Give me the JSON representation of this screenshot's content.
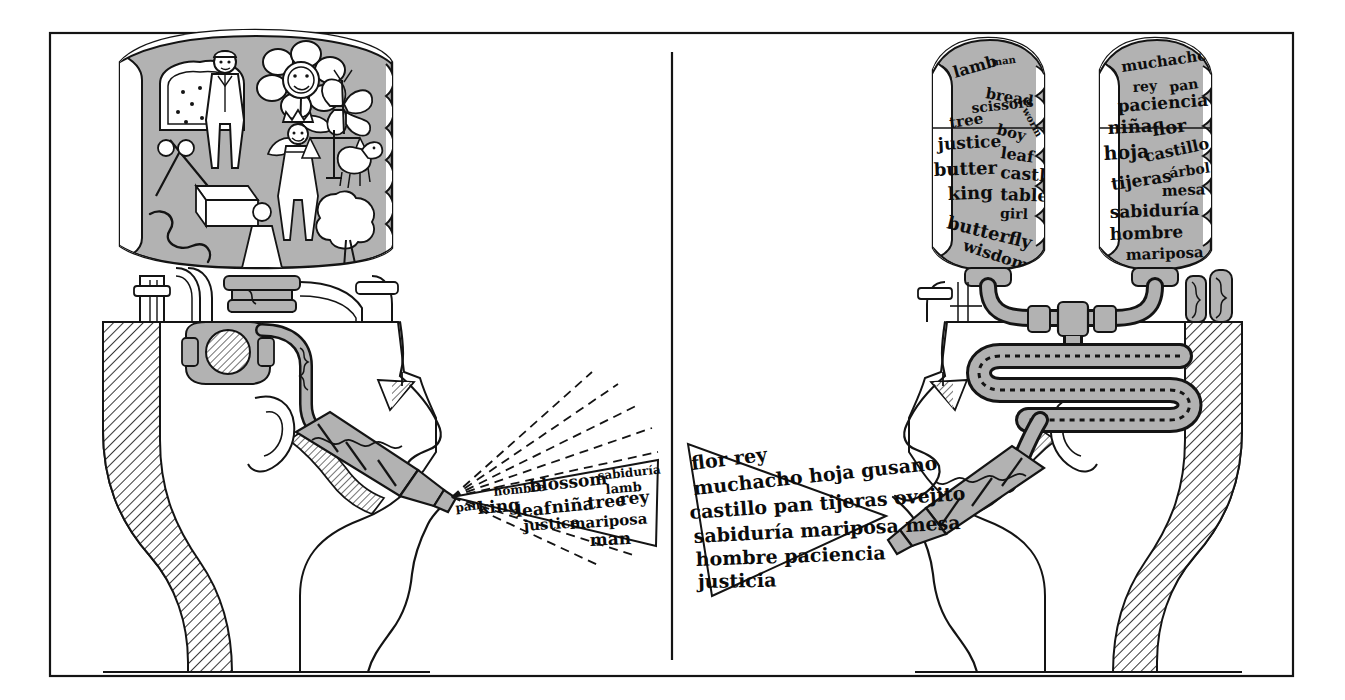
{
  "figure": {
    "caption": "",
    "style": "pen-and-ink technical cutaway",
    "colors": {
      "ink": "#141414",
      "gray": "#b2b2b2",
      "white": "#ffffff",
      "background": "#ffffff"
    },
    "frame": {
      "border_color": "#141414",
      "divider_label": "center-divider"
    }
  },
  "left_panel": {
    "name": "monolingual-head-panel",
    "description": "Head in profile facing right with a cutaway skull, a tank of pictures above, pipework inside the head, and a nozzle at the mouth emitting a cone of mixed-language words.",
    "tank": {
      "name": "picture-tank",
      "contents_type": "pictures",
      "items": [
        "bread-slice-icon",
        "man-icon",
        "flower-icon",
        "butterfly-icon",
        "king-icon",
        "scales-of-justice-icon",
        "lamb-icon",
        "tree-icon",
        "scissors-icon",
        "butter-icon",
        "worm-icon",
        "girl-icon"
      ]
    },
    "speech_cone": {
      "name": "speech-cone",
      "words": [
        "hombre",
        "blossom",
        "sabiduría",
        "pan",
        "king",
        "leaf",
        "niña",
        "tree",
        "rey",
        "lamb",
        "justice",
        "mariposa",
        "man"
      ],
      "lines": [
        "hombre blossom sabiduría",
        "lamb",
        "pan king leaf niña tree rey",
        "justice mariposa",
        "man"
      ],
      "rays": 8,
      "ray_style": "dashed"
    }
  },
  "right_panel": {
    "name": "bilingual-head-panel",
    "description": "Head in profile facing left with two word tanks above, a serpentine translation coil inside the skull, and a nozzle at the mouth emitting a cone of Spanish words.",
    "tanks": [
      {
        "name": "english-word-tank",
        "language": "English",
        "words": [
          "lamb",
          "man",
          "bread",
          "worm",
          "scissors",
          "tree",
          "boy",
          "justice",
          "leaf",
          "butter",
          "castle",
          "king",
          "table",
          "girl",
          "butterfly",
          "wisdom"
        ]
      },
      {
        "name": "spanish-word-tank",
        "language": "Spanish",
        "words": [
          "muchacho",
          "rey",
          "pan",
          "paciencia",
          "niña",
          "flor",
          "hoja",
          "castillo",
          "árbol",
          "tijeras",
          "mesa",
          "sabiduría",
          "hombre",
          "mariposa"
        ]
      }
    ],
    "speech_cone": {
      "name": "speech-cone",
      "lines": [
        "flor rey",
        "muchacho hoja gusano",
        "castillo pan tijeras ovejito",
        "árbol niña",
        "sabiduría mariposa mesa",
        "hombre paciencia",
        "justicia"
      ],
      "words": [
        "flor",
        "rey",
        "muchacho",
        "hoja",
        "gusano",
        "castillo",
        "pan",
        "tijeras",
        "ovejito",
        "árbol",
        "niña",
        "sabiduría",
        "mariposa",
        "mesa",
        "hombre",
        "paciencia",
        "justicia"
      ]
    },
    "mechanism": {
      "name": "translation-coil",
      "type": "serpentine-pipe"
    }
  }
}
